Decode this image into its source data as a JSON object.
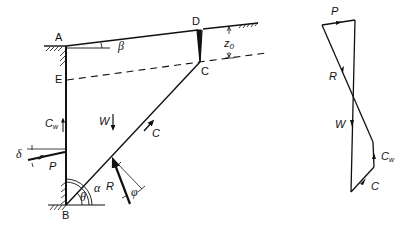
{
  "diagram": {
    "type": "retaining wall wedge analysis with force polygon",
    "points": {
      "A": "A",
      "B": "B",
      "C": "C",
      "D": "D",
      "E": "E"
    },
    "angles": {
      "beta": "β",
      "alpha": "α",
      "theta": "θ",
      "phi": "φ",
      "delta": "δ"
    },
    "dimensions": {
      "z0_main": "z",
      "z0_sub": "0"
    },
    "forces": {
      "W": "W",
      "P": "P",
      "R": "R",
      "C": "C",
      "Cw_main": "C",
      "Cw_sub": "w"
    },
    "force_polygon": {
      "P": "P",
      "R": "R",
      "W": "W",
      "Cw_main": "C",
      "Cw_sub": "w",
      "C": "C"
    }
  }
}
